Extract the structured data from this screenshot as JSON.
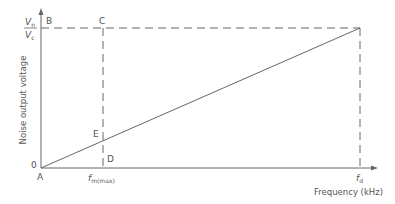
{
  "diagram": {
    "colors": {
      "line": "#666666",
      "text": "#555555",
      "background": "#ffffff"
    },
    "axes": {
      "y_label": "Noise output voltage",
      "x_label": "Frequency (kHz)",
      "origin_value": "0"
    },
    "y_tick": {
      "numerator_main": "V",
      "numerator_sub": "n",
      "denominator_main": "V",
      "denominator_sub": "c"
    },
    "x_ticks": {
      "fm_main": "f",
      "fm_sub": "m(max)",
      "fd_main": "f",
      "fd_sub": "d"
    },
    "points": {
      "A": "A",
      "B": "B",
      "C": "C",
      "D": "D",
      "E": "E"
    }
  }
}
